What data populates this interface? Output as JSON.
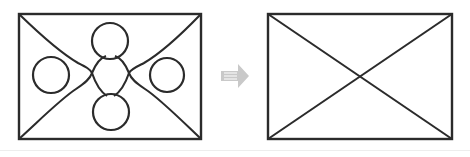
{
  "figure": {
    "caption": "",
    "background_color": "#ffffff",
    "ink_color": "#2b2b2b",
    "arrow_color": "#c9c9c9",
    "panels": [
      {
        "id": "left-panel",
        "name": "before-figure",
        "label": "",
        "rect": {
          "x": 19,
          "y": 14,
          "width": 182,
          "height": 125
        },
        "description": "rectangle with two diagonals bulged into arcs tangent to four circles",
        "circles": [
          {
            "name": "top-circle",
            "cx": 110,
            "cy": 41,
            "r": 18
          },
          {
            "name": "left-circle",
            "cx": 51,
            "cy": 75,
            "r": 18
          },
          {
            "name": "right-circle",
            "cx": 167,
            "cy": 75,
            "r": 17
          },
          {
            "name": "bottom-circle",
            "cx": 111,
            "cy": 112,
            "r": 18
          }
        ],
        "curve_paths": [
          "M 19 14 C 56 50, 74 58, 92 70 C 74 82, 56 98, 19 139",
          "M 201 14 C 164 50, 146 58, 128 70 C 146 82, 164 98, 201 139"
        ]
      },
      {
        "id": "right-panel",
        "name": "after-figure",
        "label": "",
        "rect": {
          "x": 268,
          "y": 14,
          "width": 184,
          "height": 125
        },
        "description": "rectangle with two straight diagonals forming an X",
        "circles": [],
        "diagonals": [
          {
            "name": "diagonal-tl-br",
            "x1": 268,
            "y1": 14,
            "x2": 452,
            "y2": 139
          },
          {
            "name": "diagonal-tr-bl",
            "x1": 452,
            "y1": 14,
            "x2": 268,
            "y2": 139
          }
        ]
      }
    ],
    "arrow": {
      "name": "right-arrow",
      "glyph": "right-arrow-icon",
      "x": 221,
      "y": 63,
      "width": 28,
      "height": 26,
      "points": "221,71 238,71 238,64 249,76 238,88 238,81 221,81"
    }
  }
}
